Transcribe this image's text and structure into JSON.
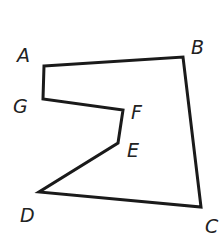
{
  "diagram": {
    "type": "polygon",
    "stroke_color": "#1a1a1a",
    "stroke_width": 3,
    "vertices": [
      {
        "name": "A",
        "x": 44,
        "y": 66
      },
      {
        "name": "B",
        "x": 183,
        "y": 57
      },
      {
        "name": "C",
        "x": 201,
        "y": 207
      },
      {
        "name": "D",
        "x": 39,
        "y": 192
      },
      {
        "name": "E",
        "x": 118,
        "y": 143
      },
      {
        "name": "F",
        "x": 123,
        "y": 110
      },
      {
        "name": "G",
        "x": 43,
        "y": 99
      }
    ],
    "labels": [
      {
        "text": "A",
        "x": 17,
        "y": 62
      },
      {
        "text": "B",
        "x": 191,
        "y": 54
      },
      {
        "text": "C",
        "x": 205,
        "y": 233
      },
      {
        "text": "D",
        "x": 20,
        "y": 222
      },
      {
        "text": "E",
        "x": 127,
        "y": 157
      },
      {
        "text": "F",
        "x": 131,
        "y": 119
      },
      {
        "text": "G",
        "x": 13,
        "y": 113
      }
    ]
  }
}
